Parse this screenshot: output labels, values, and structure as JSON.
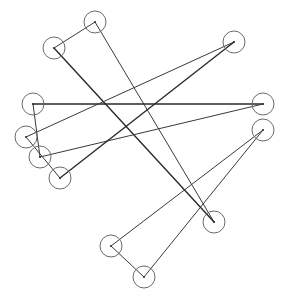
{
  "diagram": {
    "type": "graph",
    "background": "#ffffff",
    "node_radius": 11,
    "nodes": [
      {
        "id": "A",
        "x": 95,
        "y": 22
      },
      {
        "id": "B",
        "x": 54,
        "y": 48
      },
      {
        "id": "C",
        "x": 234,
        "y": 42
      },
      {
        "id": "D",
        "x": 33,
        "y": 104
      },
      {
        "id": "E",
        "x": 263,
        "y": 104
      },
      {
        "id": "F",
        "x": 26,
        "y": 137
      },
      {
        "id": "G",
        "x": 40,
        "y": 157
      },
      {
        "id": "H",
        "x": 263,
        "y": 130
      },
      {
        "id": "I",
        "x": 60,
        "y": 178
      },
      {
        "id": "J",
        "x": 214,
        "y": 222
      },
      {
        "id": "K",
        "x": 111,
        "y": 246
      },
      {
        "id": "L",
        "x": 144,
        "y": 277
      }
    ],
    "edges": [
      {
        "from": "A",
        "to": "B",
        "thick": false
      },
      {
        "from": "A",
        "to": "J",
        "thick": false
      },
      {
        "from": "B",
        "to": "J",
        "thick": true
      },
      {
        "from": "D",
        "to": "E",
        "thick": true
      },
      {
        "from": "D",
        "to": "G",
        "thick": false
      },
      {
        "from": "F",
        "to": "C",
        "thick": false
      },
      {
        "from": "F",
        "to": "I",
        "thick": false
      },
      {
        "from": "G",
        "to": "E",
        "thick": false
      },
      {
        "from": "I",
        "to": "C",
        "thick": true
      },
      {
        "from": "K",
        "to": "H",
        "thick": false
      },
      {
        "from": "K",
        "to": "L",
        "thick": false
      },
      {
        "from": "L",
        "to": "H",
        "thick": false
      }
    ]
  }
}
